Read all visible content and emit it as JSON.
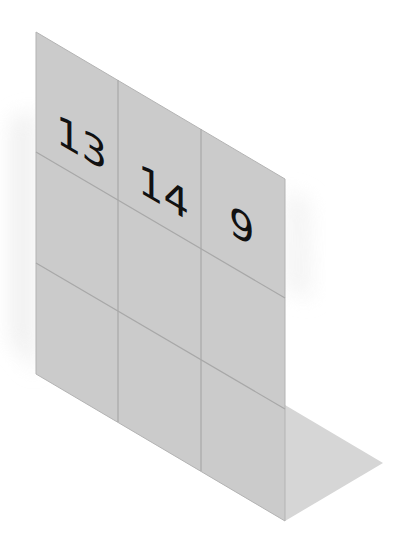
{
  "diagram": {
    "colors": {
      "background": "#ffffff",
      "wall_fill": "#cbcbcb",
      "grid_line": "#a9a9a9",
      "floor_shadow": "#d6d6d6",
      "soft_shadow": "#efefef",
      "number_color": "#111111"
    },
    "grid": {
      "rows": 3,
      "columns": 3,
      "cells": [
        {
          "row": 0,
          "col": 0,
          "value": "13"
        },
        {
          "row": 0,
          "col": 1,
          "value": "14"
        },
        {
          "row": 0,
          "col": 2,
          "value": "9"
        },
        {
          "row": 1,
          "col": 0,
          "value": ""
        },
        {
          "row": 1,
          "col": 1,
          "value": ""
        },
        {
          "row": 1,
          "col": 2,
          "value": ""
        },
        {
          "row": 2,
          "col": 0,
          "value": ""
        },
        {
          "row": 2,
          "col": 1,
          "value": ""
        },
        {
          "row": 2,
          "col": 2,
          "value": ""
        }
      ]
    },
    "labels": {
      "cell_0_0": "13",
      "cell_0_1": "14",
      "cell_0_2": "9"
    }
  }
}
